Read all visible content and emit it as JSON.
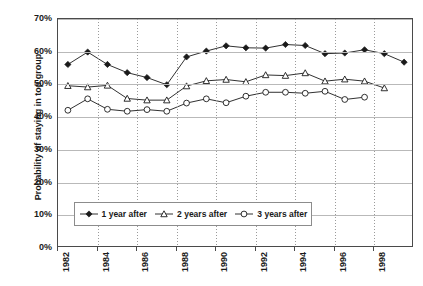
{
  "chart_data": {
    "type": "line",
    "title": "",
    "xlabel": "",
    "ylabel": "Probability of staying in top group",
    "ylim": [
      0,
      70
    ],
    "xlim": [
      1982,
      2000
    ],
    "y_tick_labels": [
      "70%",
      "60%",
      "50%",
      "40%",
      "30%",
      "20%",
      "10%",
      "0%"
    ],
    "y_tick_values": [
      70,
      60,
      50,
      40,
      30,
      20,
      10,
      0
    ],
    "x_tick_labels": [
      "1982",
      "1984",
      "1986",
      "1988",
      "1990",
      "1992",
      "1994",
      "1996",
      "1998"
    ],
    "x_tick_values": [
      1982,
      1984,
      1986,
      1988,
      1990,
      1992,
      1994,
      1996,
      1998
    ],
    "grid": "horizontal-solid-and-vertical-dotted",
    "legend_position": "inside-bottom-center",
    "series": [
      {
        "name": "1 year after",
        "marker": "filled-diamond",
        "color": "#1a1a1a",
        "x": [
          1982.5,
          1983.5,
          1984.5,
          1985.5,
          1986.5,
          1987.5,
          1988.5,
          1989.5,
          1990.5,
          1991.5,
          1992.5,
          1993.5,
          1994.5,
          1995.5,
          1996.5,
          1997.5,
          1998.5,
          1999.5
        ],
        "values": [
          56.1,
          59.9,
          56.1,
          53.6,
          52.1,
          49.9,
          58.4,
          60.2,
          61.8,
          61.2,
          61.1,
          62.2,
          61.9,
          59.4,
          59.6,
          60.6,
          59.4,
          56.8
        ]
      },
      {
        "name": "2 years after",
        "marker": "open-triangle",
        "color": "#1a1a1a",
        "x": [
          1982.5,
          1983.5,
          1984.5,
          1985.5,
          1986.5,
          1987.5,
          1988.5,
          1989.5,
          1990.5,
          1991.5,
          1992.5,
          1993.5,
          1994.5,
          1995.5,
          1996.5,
          1997.5,
          1998.5
        ],
        "values": [
          49.6,
          49.2,
          49.7,
          45.7,
          45.2,
          45.2,
          49.5,
          51.1,
          51.5,
          50.8,
          52.9,
          52.7,
          53.5,
          51.0,
          51.6,
          51.0,
          48.9
        ]
      },
      {
        "name": "3 years after",
        "marker": "open-circle",
        "color": "#1a1a1a",
        "x": [
          1982.5,
          1983.5,
          1984.5,
          1985.5,
          1986.5,
          1987.5,
          1988.5,
          1989.5,
          1990.5,
          1991.5,
          1992.5,
          1993.5,
          1994.5,
          1995.5,
          1996.5,
          1997.5
        ],
        "values": [
          42.1,
          45.6,
          42.4,
          41.8,
          42.3,
          41.8,
          44.3,
          45.6,
          44.4,
          46.4,
          47.6,
          47.6,
          47.3,
          47.9,
          45.4,
          46.1
        ]
      }
    ]
  },
  "legend": {
    "items": [
      {
        "label": "1 year after"
      },
      {
        "label": "2 years after"
      },
      {
        "label": "3 years after"
      }
    ]
  }
}
